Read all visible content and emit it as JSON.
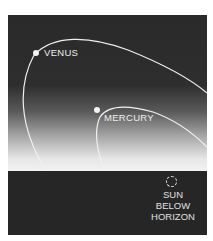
{
  "diagram": {
    "planets": [
      {
        "name": "VENUS",
        "label": "VENUS"
      },
      {
        "name": "MERCURY",
        "label": "MERCURY"
      }
    ],
    "sun": {
      "line1": "SUN",
      "line2": "BELOW",
      "line3": "HORIZON"
    },
    "colors": {
      "sky_top": "#2a2a2a",
      "horizon_glow": "#f2f2f2",
      "ground": "#262626",
      "orbit_line": "#f0f0f0"
    }
  }
}
